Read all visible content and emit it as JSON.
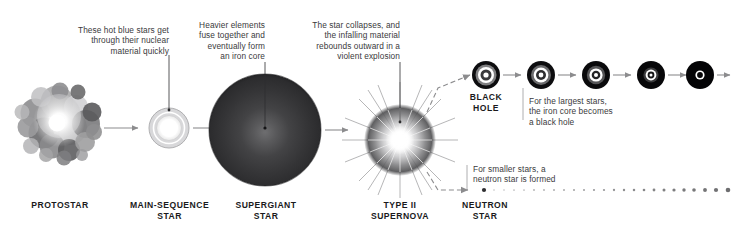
{
  "diagram": {
    "background_color": "#ffffff",
    "text_color": "#3a3a3c",
    "label_color": "#1a1a1c",
    "arrow_color": "#8c8c8e"
  },
  "annotations": [
    {
      "id": "protostar-note",
      "text": "These hot blue stars get\nthrough their nuclear\nmaterial quickly",
      "align": "right"
    },
    {
      "id": "supergiant-note",
      "text": "Heavier elements\nfuse together and\neventually form\nan iron core",
      "align": "right"
    },
    {
      "id": "supernova-note",
      "text": "The star collapses, and\nthe infalling material\nrebounds outward in a\nviolent explosion",
      "align": "right"
    },
    {
      "id": "blackhole-note",
      "text": "For the largest stars,\nthe iron core becomes\na black hole",
      "align": "left"
    },
    {
      "id": "neutronstar-note",
      "text": "For smaller stars, a\nneutron star is formed",
      "align": "left"
    }
  ],
  "stages": [
    {
      "id": "protostar",
      "label": "PROTOSTAR"
    },
    {
      "id": "main-sequence-star",
      "label": "MAIN-SEQUENCE\nSTAR"
    },
    {
      "id": "supergiant-star",
      "label": "SUPERGIANT\nSTAR"
    },
    {
      "id": "type-ii-supernova",
      "label": "TYPE II\nSUPERNOVA"
    },
    {
      "id": "black-hole",
      "label": "BLACK\nHOLE"
    },
    {
      "id": "neutron-star",
      "label": "NEUTRON\nSTAR"
    }
  ]
}
